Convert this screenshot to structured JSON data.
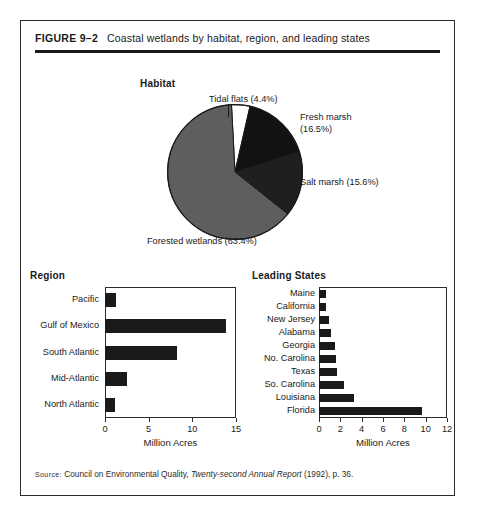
{
  "figure": {
    "number": "FIGURE 9–2",
    "caption": "Coastal wetlands by habitat, region, and leading states",
    "source_word": "Source:",
    "source_pre": " Council on Environmental Quality, ",
    "source_italic": "Twenty-second Annual Report",
    "source_post": " (1992), p. 36."
  },
  "sections": {
    "habitat_title": "Habitat",
    "region_title": "Region",
    "states_title": "Leading States"
  },
  "chart_data": [
    {
      "type": "pie",
      "title": "Habitat",
      "legend_position": "callout-labels",
      "categories": [
        "Tidal flats",
        "Fresh marsh",
        "Salt marsh",
        "Forested wetlands"
      ],
      "values": [
        4.4,
        16.5,
        15.6,
        63.4
      ],
      "unit": "percent",
      "labels": [
        "Tidal flats (4.4%)",
        "Fresh marsh (16.5%)",
        "Salt marsh (15.6%)",
        "Forested wetlands (63.4%)"
      ],
      "colors": [
        "#ffffff",
        "#121212",
        "#1f1f1f",
        "#5e5e5e"
      ]
    },
    {
      "type": "bar",
      "orientation": "horizontal",
      "title": "Region",
      "xlabel": "Million Acres",
      "ylabel": "",
      "xlim": [
        0,
        15
      ],
      "xticks": [
        0,
        5,
        10,
        15
      ],
      "xtick_labels": [
        "0",
        "5",
        "10",
        "15"
      ],
      "grid": false,
      "categories": [
        "Pacific",
        "Gulf of Mexico",
        "South Atlantic",
        "Mid-Atlantic",
        "North Atlantic"
      ],
      "values": [
        1.3,
        13.9,
        8.2,
        2.5,
        1.2
      ],
      "bar_color": "#1a1a1a"
    },
    {
      "type": "bar",
      "orientation": "horizontal",
      "title": "Leading States",
      "xlabel": "Million Acres",
      "ylabel": "",
      "xlim": [
        0,
        12
      ],
      "xticks": [
        0,
        2,
        4,
        6,
        8,
        10,
        12
      ],
      "xtick_labels": [
        "0",
        "2",
        "4",
        "6",
        "8",
        "10",
        "12"
      ],
      "grid": false,
      "categories": [
        "Maine",
        "California",
        "New Jersey",
        "Alabama",
        "Georgia",
        "No. Carolina",
        "Texas",
        "So. Carolina",
        "Louisiana",
        "Florida"
      ],
      "values": [
        0.7,
        0.7,
        0.9,
        1.1,
        1.5,
        1.6,
        1.7,
        2.3,
        3.3,
        9.7
      ],
      "bar_color": "#1a1a1a"
    }
  ]
}
